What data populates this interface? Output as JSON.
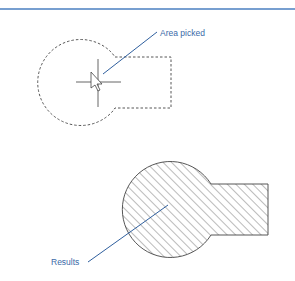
{
  "colors": {
    "rule": "#4a7fc0",
    "leader": "#2f5f9e",
    "label": "#3a6aa8",
    "outline": "#444444",
    "hatch": "#555555"
  },
  "top_figure": {
    "description": "Boundary before picking — dashed outline of circle joined to rectangle, with crosshair cursor inside",
    "callout": {
      "label": "Area picked"
    }
  },
  "bottom_figure": {
    "description": "Result — closed boundary with hatch fill",
    "callout": {
      "label": "Results"
    }
  }
}
